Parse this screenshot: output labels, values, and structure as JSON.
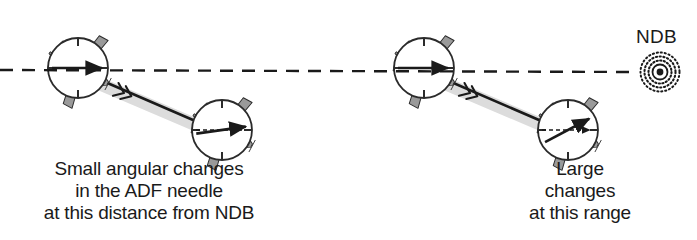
{
  "figure": {
    "background_color": "#ffffff",
    "ink_color": "#1a1a1a",
    "aircraft_fill": "#9a9a9a",
    "aircraft_stroke": "#2b2b2b",
    "gauge_fill": "#ffffff",
    "shadow_color": "#d8d8d8"
  },
  "labels": {
    "ndb": "NDB",
    "left_caption": {
      "line1": "Small angular changes",
      "line2": "in the ADF needle",
      "line3": "at this distance from NDB"
    },
    "right_caption": {
      "line1": "Large",
      "line2": "changes",
      "line3": "at this range"
    }
  },
  "scenarios": [
    {
      "id": "far-from-ndb",
      "caption_key": "left_caption",
      "needle_change": "small",
      "aircraft": [
        {
          "id": "far-aircraft-1",
          "x": 78,
          "y": 68,
          "heading_deg": 28,
          "needle_deg": 0
        },
        {
          "id": "far-aircraft-2",
          "x": 222,
          "y": 130,
          "heading_deg": 28,
          "needle_deg": -8
        }
      ]
    },
    {
      "id": "near-ndb",
      "caption_key": "right_caption",
      "needle_change": "large",
      "aircraft": [
        {
          "id": "near-aircraft-1",
          "x": 424,
          "y": 68,
          "heading_deg": 28,
          "needle_deg": 0
        },
        {
          "id": "near-aircraft-2",
          "x": 568,
          "y": 130,
          "heading_deg": 28,
          "needle_deg": -28
        }
      ]
    }
  ],
  "ndb_station": {
    "x": 660,
    "y": 72,
    "symbol": "ndb-beacon-icon"
  },
  "bearing_line": {
    "style": "dashed",
    "from_x": 0,
    "from_y": 70,
    "to_x": 648,
    "to_y": 72
  },
  "track_chevrons": [
    {
      "scenario": "far-from-ndb",
      "x": 124,
      "y": 93
    },
    {
      "scenario": "near-ndb",
      "x": 470,
      "y": 93
    }
  ]
}
